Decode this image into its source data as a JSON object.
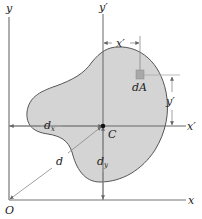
{
  "figure": {
    "type": "parallel-axis-theorem area diagram",
    "colors": {
      "area_fill": "#d4d4d4",
      "outline": "#555555",
      "axis": "#777777",
      "dimension": "#888888",
      "centroid": "#111111",
      "element": "#a8a8a8",
      "text": "#222222"
    },
    "labels": {
      "y_axis": "y",
      "x_axis": "x",
      "origin": "O",
      "y_prime_axis": "y′",
      "x_prime_axis": "x′",
      "centroid": "C",
      "element": "dA",
      "x_prime_dim": "x′",
      "y_prime_dim": "y′",
      "dx_main": "d",
      "dx_sub": "x",
      "dy_main": "d",
      "dy_sub": "y",
      "d": "d"
    }
  }
}
